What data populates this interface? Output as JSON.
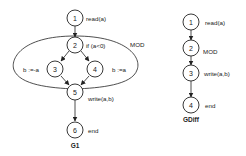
{
  "g1": {
    "title": "G1",
    "region_label": "MOD",
    "nodes": [
      {
        "id": "1",
        "label": "read(a)"
      },
      {
        "id": "2",
        "label": "if (a<0)"
      },
      {
        "id": "3",
        "label": "b :=-a"
      },
      {
        "id": "4",
        "label": "b :=a"
      },
      {
        "id": "5",
        "label": "write(a,b)"
      },
      {
        "id": "6",
        "label": "end"
      }
    ],
    "edges": [
      [
        "1",
        "2"
      ],
      [
        "2",
        "3"
      ],
      [
        "2",
        "4"
      ],
      [
        "3",
        "5"
      ],
      [
        "4",
        "5"
      ],
      [
        "5",
        "6"
      ]
    ]
  },
  "gdiff": {
    "title": "GDiff",
    "nodes": [
      {
        "id": "1",
        "label": "read(a)"
      },
      {
        "id": "2",
        "label": "MOD"
      },
      {
        "id": "3",
        "label": "write(a,b)"
      },
      {
        "id": "4",
        "label": "end"
      }
    ],
    "edges": [
      [
        "1",
        "2"
      ],
      [
        "2",
        "3"
      ],
      [
        "3",
        "4"
      ]
    ]
  },
  "colors": {
    "stroke": "#222222",
    "background": "#ffffff"
  }
}
